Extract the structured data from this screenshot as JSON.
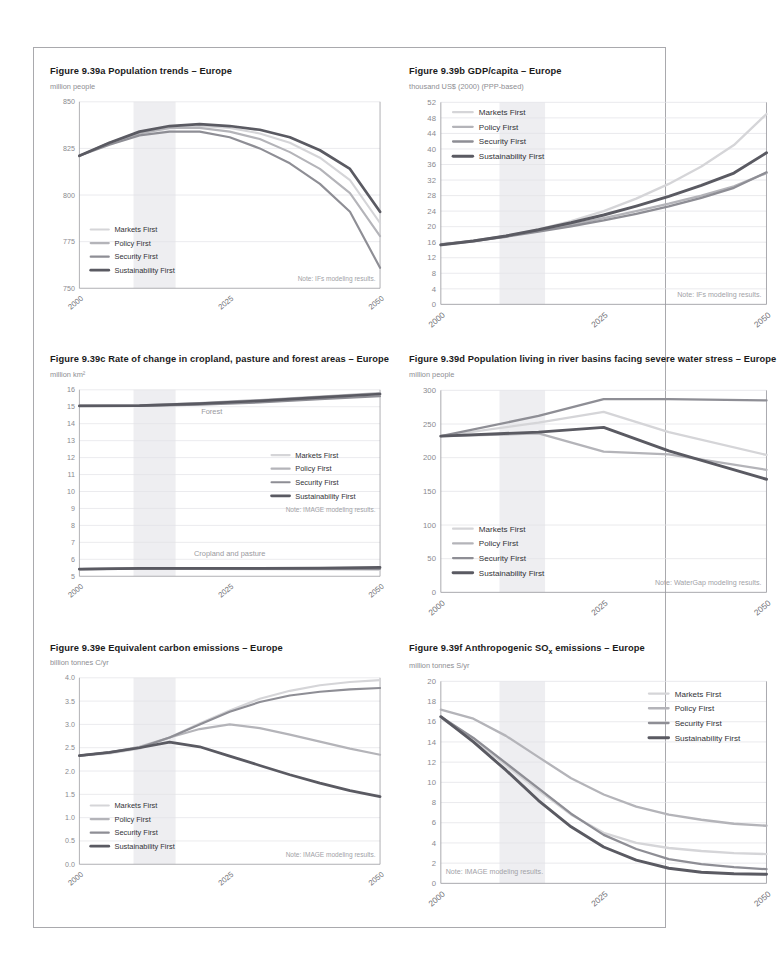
{
  "page": {
    "figure_group": "Figure 9.39",
    "region": "Europe"
  },
  "series_meta": [
    {
      "name": "Markets First",
      "color": "#d5d5d8",
      "width": 1.9
    },
    {
      "name": "Policy First",
      "color": "#b4b4b9",
      "width": 1.9
    },
    {
      "name": "Security First",
      "color": "#8e8e95",
      "width": 1.9
    },
    {
      "name": "Sustainability First",
      "color": "#5a5a62",
      "width": 2.4
    }
  ],
  "x_ticks": [
    "2000",
    "2025",
    "2050"
  ],
  "charts": [
    {
      "id": "fig-939a",
      "title": "Figure 9.39a Population trends – Europe",
      "unit": "million people",
      "note": "Note: IFs modeling results.",
      "chart_data": {
        "type": "line",
        "title": "Figure 9.39a Population trends – Europe",
        "xlabel": "",
        "ylabel": "million people",
        "xlim": [
          2000,
          2050
        ],
        "ylim": [
          750,
          850
        ],
        "yticks": [
          750,
          775,
          800,
          825,
          850
        ],
        "xticks": [
          2000,
          2025,
          2050
        ],
        "grid": true,
        "legend": "bottom-left",
        "shaded_band": [
          2009,
          2016
        ],
        "x": [
          2000,
          2005,
          2010,
          2015,
          2020,
          2025,
          2030,
          2035,
          2040,
          2045,
          2050
        ],
        "series": [
          {
            "name": "Markets First",
            "values": [
              821,
              828,
              833,
              836,
              837,
              836,
              833,
              828,
              820,
              808,
              785
            ]
          },
          {
            "name": "Policy First",
            "values": [
              821,
              828,
              833,
              836,
              836,
              834,
              830,
              823,
              814,
              801,
              778
            ]
          },
          {
            "name": "Security First",
            "values": [
              821,
              827,
              832,
              834,
              834,
              831,
              825,
              817,
              806,
              791,
              761
            ]
          },
          {
            "name": "Sustainability First",
            "values": [
              821,
              828,
              834,
              837,
              838,
              837,
              835,
              831,
              824,
              814,
              791
            ]
          }
        ]
      }
    },
    {
      "id": "fig-939b",
      "title": "Figure 9.39b GDP/capita – Europe",
      "unit": "thousand US$ (2000) (PPP-based)",
      "note": "Note: IFs modeling results.",
      "chart_data": {
        "type": "line",
        "title": "Figure 9.39b GDP/capita – Europe",
        "xlabel": "",
        "ylabel": "thousand US$ (2000) (PPP-based)",
        "xlim": [
          2000,
          2050
        ],
        "ylim": [
          0,
          52
        ],
        "yticks": [
          0,
          4,
          8,
          12,
          16,
          20,
          24,
          28,
          32,
          36,
          40,
          44,
          48,
          52
        ],
        "xticks": [
          2000,
          2025,
          2050
        ],
        "grid": true,
        "legend": "top-left",
        "shaded_band": [
          2009,
          2016
        ],
        "x": [
          2000,
          2005,
          2010,
          2015,
          2020,
          2025,
          2030,
          2035,
          2040,
          2045,
          2050
        ],
        "series": [
          {
            "name": "Markets First",
            "values": [
              15.2,
              16.2,
              17.6,
              19.3,
              21.4,
              24.0,
              27.2,
              31.0,
              35.5,
              41.0,
              49.0
            ]
          },
          {
            "name": "Policy First",
            "values": [
              15.4,
              16.4,
              17.6,
              19.0,
              20.5,
              22.2,
              24.0,
              25.9,
              28.0,
              30.4,
              33.8
            ]
          },
          {
            "name": "Security First",
            "values": [
              15.4,
              16.3,
              17.4,
              18.7,
              20.1,
              21.6,
              23.3,
              25.2,
              27.4,
              30.0,
              34.0
            ]
          },
          {
            "name": "Sustainability First",
            "values": [
              15.3,
              16.3,
              17.6,
              19.2,
              21.0,
              23.0,
              25.3,
              27.8,
              30.6,
              33.8,
              39.0
            ]
          }
        ]
      }
    },
    {
      "id": "fig-939c",
      "title": "Figure 9.39c Rate of change in cropland, pasture and forest areas – Europe",
      "unit": "million km²",
      "note": "Note: IMAGE modeling results.",
      "inline_labels": [
        {
          "text": "Forest",
          "x": 2022,
          "y": 14.55
        },
        {
          "text": "Cropland and pasture",
          "x": 2025,
          "y": 6.2
        }
      ],
      "chart_data": {
        "type": "line",
        "title": "Figure 9.39c Rate of change in cropland, pasture and forest areas – Europe",
        "xlabel": "",
        "ylabel": "million km²",
        "xlim": [
          2000,
          2050
        ],
        "ylim": [
          5,
          16
        ],
        "yticks": [
          5,
          6,
          7,
          8,
          9,
          10,
          11,
          12,
          13,
          14,
          15,
          16
        ],
        "xticks": [
          2000,
          2025,
          2050
        ],
        "grid": true,
        "legend": "middle-right",
        "shaded_band": [
          2009,
          2016
        ],
        "x": [
          2000,
          2010,
          2020,
          2030,
          2040,
          2050
        ],
        "groups": [
          {
            "group": "Forest",
            "series": [
              {
                "name": "Markets First",
                "values": [
                  15.05,
                  15.05,
                  15.15,
                  15.3,
                  15.5,
                  15.7
                ]
              },
              {
                "name": "Policy First",
                "values": [
                  15.05,
                  15.08,
                  15.22,
                  15.4,
                  15.6,
                  15.8
                ]
              },
              {
                "name": "Security First",
                "values": [
                  15.05,
                  15.05,
                  15.12,
                  15.25,
                  15.45,
                  15.62
                ]
              },
              {
                "name": "Sustainability First",
                "values": [
                  15.05,
                  15.06,
                  15.18,
                  15.35,
                  15.55,
                  15.75
                ]
              }
            ]
          },
          {
            "group": "Cropland and pasture",
            "series": [
              {
                "name": "Markets First",
                "values": [
                  5.42,
                  5.45,
                  5.44,
                  5.42,
                  5.4,
                  5.38
                ]
              },
              {
                "name": "Policy First",
                "values": [
                  5.42,
                  5.46,
                  5.46,
                  5.45,
                  5.45,
                  5.48
                ]
              },
              {
                "name": "Security First",
                "values": [
                  5.42,
                  5.45,
                  5.45,
                  5.44,
                  5.43,
                  5.44
                ]
              },
              {
                "name": "Sustainability First",
                "values": [
                  5.42,
                  5.47,
                  5.47,
                  5.47,
                  5.48,
                  5.52
                ]
              }
            ]
          }
        ]
      }
    },
    {
      "id": "fig-939d",
      "title": "Figure 9.39d Population living in river basins facing severe water stress – Europe",
      "unit": "million people",
      "note": "Note: WaterGap modeling results.",
      "chart_data": {
        "type": "line",
        "title": "Figure 9.39d Population living in river basins facing severe water stress – Europe",
        "xlabel": "",
        "ylabel": "million people",
        "xlim": [
          2000,
          2050
        ],
        "ylim": [
          0,
          300
        ],
        "yticks": [
          0,
          50,
          100,
          150,
          200,
          250,
          300
        ],
        "xticks": [
          2000,
          2025,
          2050
        ],
        "grid": true,
        "legend": "bottom-left",
        "shaded_band": [
          2009,
          2016
        ],
        "x": [
          2000,
          2015,
          2025,
          2035,
          2050
        ],
        "series": [
          {
            "name": "Markets First",
            "values": [
              232,
              252,
              268,
              238,
              204
            ]
          },
          {
            "name": "Policy First",
            "values": [
              232,
              236,
              209,
              205,
              182
            ]
          },
          {
            "name": "Security First",
            "values": [
              232,
              262,
              287,
              287,
              285
            ]
          },
          {
            "name": "Sustainability First",
            "values": [
              232,
              238,
              245,
              210,
              168
            ]
          }
        ]
      }
    },
    {
      "id": "fig-939e",
      "title": "Figure 9.39e Equivalent carbon emissions – Europe",
      "unit": "billion tonnes C/yr",
      "note": "Note: IMAGE modeling results.",
      "chart_data": {
        "type": "line",
        "title": "Figure 9.39e Equivalent carbon emissions – Europe",
        "xlabel": "",
        "ylabel": "billion tonnes C/yr",
        "xlim": [
          2000,
          2050
        ],
        "ylim": [
          0.0,
          4.0
        ],
        "yticks": [
          0.0,
          0.5,
          1.0,
          1.5,
          2.0,
          2.5,
          3.0,
          3.5,
          4.0
        ],
        "xticks": [
          2000,
          2025,
          2050
        ],
        "grid": true,
        "legend": "bottom-left",
        "shaded_band": [
          2009,
          2016
        ],
        "x": [
          2000,
          2005,
          2010,
          2015,
          2020,
          2025,
          2030,
          2035,
          2040,
          2045,
          2050
        ],
        "series": [
          {
            "name": "Markets First",
            "values": [
              2.33,
              2.38,
              2.48,
              2.72,
              3.02,
              3.3,
              3.55,
              3.72,
              3.84,
              3.91,
              3.95
            ]
          },
          {
            "name": "Policy First",
            "values": [
              2.33,
              2.4,
              2.52,
              2.72,
              2.9,
              3.0,
              2.92,
              2.78,
              2.63,
              2.48,
              2.35
            ]
          },
          {
            "name": "Security First",
            "values": [
              2.33,
              2.4,
              2.5,
              2.72,
              3.0,
              3.27,
              3.48,
              3.62,
              3.7,
              3.75,
              3.78
            ]
          },
          {
            "name": "Sustainability First",
            "values": [
              2.33,
              2.4,
              2.5,
              2.62,
              2.52,
              2.32,
              2.12,
              1.92,
              1.74,
              1.58,
              1.45
            ]
          }
        ]
      }
    },
    {
      "id": "fig-939f",
      "title": "Figure 9.39f Anthropogenic SOx emissions – Europe",
      "title_main": "Figure 9.39f Anthropogenic SO",
      "title_sub": "x",
      "title_tail": " emissions – Europe",
      "unit": "million tonnes S/yr",
      "note": "Note: IMAGE modeling results.",
      "chart_data": {
        "type": "line",
        "title": "Figure 9.39f Anthropogenic SOx emissions – Europe",
        "xlabel": "",
        "ylabel": "million tonnes S/yr",
        "xlim": [
          2000,
          2050
        ],
        "ylim": [
          0,
          20
        ],
        "yticks": [
          0,
          2,
          4,
          6,
          8,
          10,
          12,
          14,
          16,
          18,
          20
        ],
        "xticks": [
          2000,
          2025,
          2050
        ],
        "grid": true,
        "legend": "top-right",
        "shaded_band": [
          2009,
          2016
        ],
        "x": [
          2000,
          2005,
          2010,
          2015,
          2020,
          2025,
          2030,
          2035,
          2040,
          2045,
          2050
        ],
        "series": [
          {
            "name": "Markets First",
            "values": [
              16.4,
              14.2,
              11.7,
              9.2,
              6.8,
              5.0,
              4.0,
              3.5,
              3.2,
              3.0,
              2.9
            ]
          },
          {
            "name": "Policy First",
            "values": [
              17.2,
              16.3,
              14.6,
              12.5,
              10.4,
              8.8,
              7.6,
              6.8,
              6.3,
              5.9,
              5.7
            ]
          },
          {
            "name": "Security First",
            "values": [
              16.5,
              14.4,
              11.9,
              9.4,
              6.9,
              4.8,
              3.4,
              2.4,
              1.9,
              1.6,
              1.4
            ]
          },
          {
            "name": "Sustainability First",
            "values": [
              16.5,
              14.0,
              11.2,
              8.2,
              5.6,
              3.6,
              2.3,
              1.5,
              1.1,
              0.95,
              0.9
            ]
          }
        ]
      }
    }
  ]
}
